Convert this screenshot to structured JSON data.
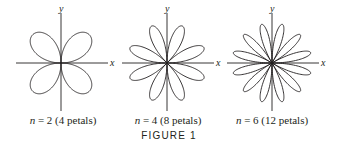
{
  "figure": {
    "title": "FIGURE 1",
    "axis_labels": {
      "x": "x",
      "y": "y"
    },
    "graphs": [
      {
        "n": 2,
        "n_label": "n",
        "caption": "= 2 (4 petals)",
        "petals": 4,
        "cx": 61,
        "cy": 63,
        "r": 40
      },
      {
        "n": 4,
        "n_label": "n",
        "caption": "= 4 (8 petals)",
        "petals": 8,
        "cx": 167,
        "cy": 63,
        "r": 40
      },
      {
        "n": 6,
        "n_label": "n",
        "caption": "= 6 (12 petals)",
        "petals": 12,
        "cx": 272,
        "cy": 63,
        "r": 40
      }
    ],
    "colors": {
      "stroke": "#231f20",
      "background": "#ffffff"
    }
  }
}
